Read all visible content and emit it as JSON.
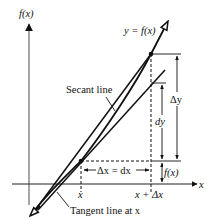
{
  "diagram": {
    "axes": {
      "y_label": "f(x)",
      "x_label": "x"
    },
    "curve_label": "y = f(x)",
    "secant_label": "Secant line",
    "tangent_label": "Tangent line at x",
    "x_tick_1": "x",
    "x_tick_2": "x + Δx",
    "delta_x_label": "Δx = dx",
    "delta_y_label": "Δy",
    "dy_label": "dy",
    "fx_label": "f(x)",
    "colors": {
      "line": "#111111",
      "y_axis": "#777777",
      "background": "#ffffff"
    }
  }
}
